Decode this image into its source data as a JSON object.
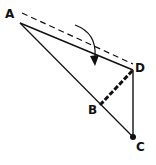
{
  "diagram": {
    "labels": {
      "A": "A",
      "B": "B",
      "C": "C",
      "D": "D"
    },
    "points": {
      "A": [
        20,
        23
      ],
      "B": [
        100,
        105
      ],
      "C": [
        133,
        137
      ],
      "D": [
        133,
        70
      ]
    },
    "colors": {
      "line": "#111111",
      "background": "#ffffff"
    },
    "elements": [
      {
        "type": "dashed-line",
        "from": "A'",
        "to": "D",
        "description": "original position of folded edge"
      },
      {
        "type": "line",
        "from": "A",
        "to": "D"
      },
      {
        "type": "line",
        "from": "A",
        "to": "C"
      },
      {
        "type": "line",
        "from": "D",
        "to": "C"
      },
      {
        "type": "thick-dashed-line",
        "from": "B",
        "to": "D",
        "description": "fold line"
      },
      {
        "type": "curved-arrow",
        "description": "rotation/fold direction"
      },
      {
        "type": "dot",
        "at": "C"
      }
    ]
  }
}
